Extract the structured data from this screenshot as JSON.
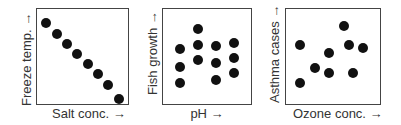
{
  "chart_data": [
    {
      "type": "scatter",
      "title": "",
      "xlabel": "Salt conc. →",
      "ylabel": "Freeze temp. →",
      "grid": false,
      "legend": null,
      "ticks": "none",
      "trend": "strong negative",
      "x": [
        1,
        2,
        3,
        4,
        5,
        6,
        7,
        8
      ],
      "y": [
        8,
        7,
        6,
        5,
        4,
        3,
        2,
        0.6
      ]
    },
    {
      "type": "scatter",
      "title": "",
      "xlabel": "pH →",
      "ylabel": "Fish growth →",
      "grid": false,
      "legend": null,
      "ticks": "none",
      "trend": "no correlation",
      "x": [
        1,
        1,
        1,
        2,
        2,
        2,
        3,
        3,
        3,
        4,
        4,
        4
      ],
      "y": [
        5.5,
        3.7,
        2.2,
        7.4,
        5.9,
        4.4,
        5.8,
        4.1,
        2.5,
        6.1,
        4.6,
        3.1
      ]
    },
    {
      "type": "scatter",
      "title": "",
      "xlabel": "Ozone conc. →",
      "ylabel": "Asthma cases →",
      "grid": false,
      "legend": null,
      "ticks": "none",
      "trend": "weak positive",
      "x": [
        1,
        1,
        2,
        3,
        3,
        4,
        4.3,
        4.6,
        5.3
      ],
      "y": [
        5.9,
        2.2,
        3.6,
        5.1,
        3.1,
        7.7,
        5.9,
        3.1,
        5.6
      ]
    }
  ],
  "panels": [
    {
      "xlabel": "Salt conc. →",
      "ylabel": "Freeze temp. →"
    },
    {
      "xlabel": "pH →",
      "ylabel": "Fish growth →"
    },
    {
      "xlabel": "Ozone conc. →",
      "ylabel": "Asthma cases →"
    }
  ],
  "colors": {
    "dot": "#111111",
    "axis": "#444444",
    "text": "#333333"
  }
}
